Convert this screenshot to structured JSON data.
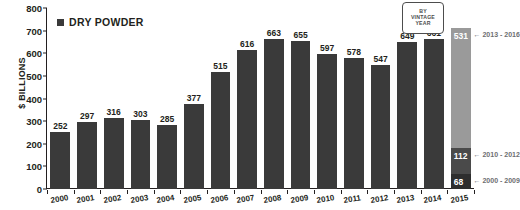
{
  "chart_data": {
    "type": "bar",
    "title": "",
    "xlabel": "",
    "ylabel": "$ BILLIONS",
    "ylim": [
      0,
      800
    ],
    "grid": false,
    "legend_position": "top-left",
    "legend": [
      {
        "name": "DRY POWDER",
        "color": "#3a3a3a"
      }
    ],
    "categories": [
      "2000",
      "2001",
      "2002",
      "2003",
      "2004",
      "2005",
      "2006",
      "2007",
      "2008",
      "2009",
      "2010",
      "2011",
      "2012",
      "2013",
      "2014",
      "2015"
    ],
    "values": [
      252,
      297,
      316,
      303,
      285,
      377,
      515,
      616,
      663,
      655,
      597,
      578,
      547,
      649,
      661,
      711
    ],
    "ytick_labels": [
      "800",
      "700",
      "600",
      "500",
      "400",
      "300",
      "200",
      "100",
      "0"
    ],
    "ytick_values": [
      800,
      700,
      600,
      500,
      400,
      300,
      200,
      100,
      0
    ],
    "stacked_last_bar": {
      "category": "2015",
      "total": 711,
      "segments": [
        {
          "label": "531",
          "value": 531,
          "note": "2013 - 2016",
          "color": "#9a9a9a"
        },
        {
          "label": "112",
          "value": 112,
          "note": "2010 - 2012",
          "color": "#4a4a4a"
        },
        {
          "label": "68",
          "value": 68,
          "note": "2000 - 2009",
          "color": "#2e2e2e"
        }
      ]
    },
    "annotation_box": {
      "lines": [
        "BY",
        "VINTAGE",
        "YEAR"
      ]
    }
  },
  "colors": {
    "bar": "#3a3a3a",
    "axis": "#231f20",
    "note_text": "#6d6e71",
    "callout_border": "#4d4d4d",
    "background": "#ffffff"
  }
}
